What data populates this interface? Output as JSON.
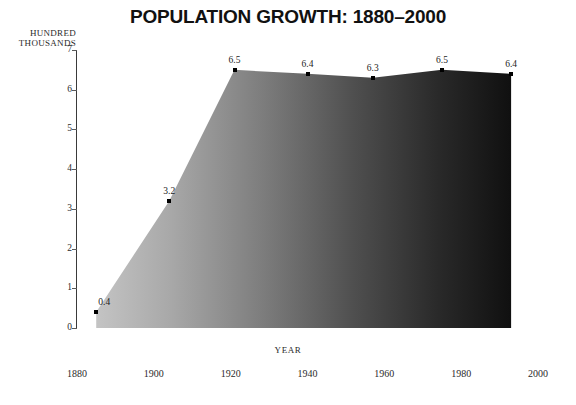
{
  "chart_data": {
    "type": "area",
    "title": "POPULATION GROWTH: 1880–2000",
    "xlabel": "YEAR",
    "ylabel": "HUNDRED THOUSANDS",
    "ylabel_lines": [
      "HUNDRED",
      "THOUSANDS"
    ],
    "x": [
      1885,
      1904,
      1921,
      1940,
      1957,
      1975,
      1993
    ],
    "values": [
      0.4,
      3.2,
      6.5,
      6.4,
      6.3,
      6.5,
      6.4
    ],
    "point_labels": [
      "0.4",
      "3.2",
      "6.5",
      "6.4",
      "6.3",
      "6.5",
      "6.4"
    ],
    "xlim": [
      1880,
      2000
    ],
    "ylim": [
      0,
      7
    ],
    "x_ticks": [
      "1880",
      "1900",
      "1920",
      "1940",
      "1960",
      "1980",
      "2000"
    ],
    "x_tick_values": [
      1880,
      1900,
      1920,
      1940,
      1960,
      1980,
      2000
    ],
    "y_ticks": [
      "7",
      "6",
      "5",
      "4",
      "3",
      "2",
      "1",
      "0"
    ],
    "y_tick_values": [
      7,
      6,
      5,
      4,
      3,
      2,
      1,
      0
    ],
    "grid": false,
    "legend": "none",
    "fill_gradient": {
      "from": "#b9b9b9",
      "to": "#141414",
      "direction": "left-to-right"
    },
    "axis_color": "#3a3a3a",
    "marker_color": "#000000",
    "background": "#ffffff"
  }
}
